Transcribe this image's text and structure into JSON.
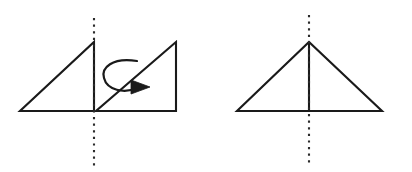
{
  "figure": {
    "background_color": "#ffffff",
    "stroke_color": "#1a1a1a",
    "axis_color": "#2b2b2b",
    "canvas": {
      "width": 412,
      "height": 172
    },
    "left_panel": {
      "name": "before-rotation",
      "axis": {
        "name": "vertical-dashed-axis",
        "x": 94,
        "y_top": 18,
        "y_bottom": 166,
        "style": "dashed"
      },
      "triangle_left": {
        "name": "left-right-triangle",
        "points": "20,111 94,111 94,42",
        "description": "right triangle, right angle at bottom-right, apex above axis"
      },
      "triangle_right": {
        "name": "right-right-triangle",
        "points": "96,111 176,111 176,42",
        "description": "right triangle, right angle at bottom-right, vertical right leg"
      },
      "rotation_arrow": {
        "name": "rotation-arrow",
        "loop_path": "M137,61 C112,57 101,68 104,78 C107,90 124,94 137,88",
        "head_points": "131,80 150,87 131,94",
        "direction": "clockwise-around-vertical-axis"
      }
    },
    "right_panel": {
      "name": "after-rotation",
      "axis": {
        "name": "vertical-dashed-axis",
        "x": 309,
        "y_top": 15,
        "y_bottom": 166,
        "style": "dashed"
      },
      "triangle": {
        "name": "isosceles-triangle",
        "points": "237,111 382,111 309,42",
        "description": "isosceles triangle formed by the two right triangles joined"
      },
      "median": {
        "name": "vertical-median-line",
        "x": 309,
        "y_top": 42,
        "y_bottom": 111,
        "style": "solid"
      }
    }
  }
}
